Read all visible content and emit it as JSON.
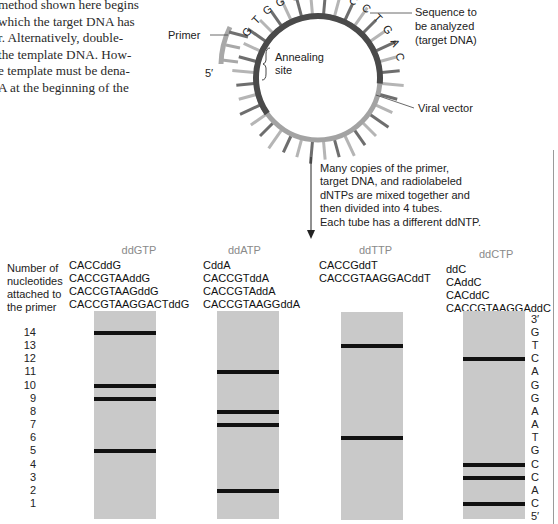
{
  "intro_text": [
    "method shown here begins",
    "which the target DNA has",
    "r. Alternatively, double-",
    "the template DNA. How-",
    "e template must be dena-",
    "A at the beginning of the"
  ],
  "circle": {
    "primer_label": "Primer",
    "primer_end_label": "5′",
    "annealing_label": [
      "Annealing",
      "site"
    ],
    "target_label": [
      "Sequence to",
      "be analyzed",
      "(target DNA)"
    ],
    "vector_label": "Viral vector",
    "target_letters": [
      "G",
      "T",
      "G",
      "G",
      "C",
      "",
      "T",
      "T",
      "C",
      "C",
      "T",
      "G",
      "A",
      "C"
    ],
    "colors": {
      "target_arc": "#4a4a4a",
      "vector_arc": "#9a9a9a",
      "primer": "#a8a8a8",
      "spoke_dark": "#6e6e6e",
      "spoke_light": "#b5b5b5"
    }
  },
  "step_text": [
    "Many copies of the primer,",
    "target DNA, and radiolabeled",
    "dNTPs are mixed together and",
    "then divided into 4 tubes.",
    "Each tube has a different ddNTP."
  ],
  "axis": {
    "title": [
      "Number of",
      "nucleotides",
      "attached to",
      "the primer"
    ],
    "numbers": [
      "14",
      "13",
      "12",
      "11",
      "10",
      "9",
      "8",
      "7",
      "6",
      "5",
      "4",
      "3",
      "2",
      "1"
    ]
  },
  "lanes": [
    {
      "ddntp": "ddGTP",
      "products": [
        "CACCddG",
        "CACCGTAAddG",
        "CACCGTAAGddG",
        "CACCGTAAGGACTddG"
      ],
      "bands": [
        14,
        10,
        9,
        5
      ]
    },
    {
      "ddntp": "ddATP",
      "products": [
        "CddA",
        "CACCGTddA",
        "CACCGTAddA",
        "CACCGTAAGGddA"
      ],
      "bands": [
        11,
        8,
        7,
        2
      ]
    },
    {
      "ddntp": "ddTTP",
      "products": [
        "CACCGddT",
        "CACCGTAAGGACddT"
      ],
      "bands": [
        13,
        6
      ]
    },
    {
      "ddntp": "ddCTP",
      "products": [
        "ddC",
        "CAddC",
        "CACddC",
        "CACCGTAAGGAddC"
      ],
      "bands": [
        12,
        4,
        3,
        1
      ]
    }
  ],
  "read_sequence": {
    "top_label": "3′",
    "bases": [
      "G",
      "T",
      "C",
      "A",
      "G",
      "G",
      "A",
      "A",
      "T",
      "G",
      "C",
      "C",
      "A",
      "C"
    ],
    "bottom_label": "5′"
  }
}
